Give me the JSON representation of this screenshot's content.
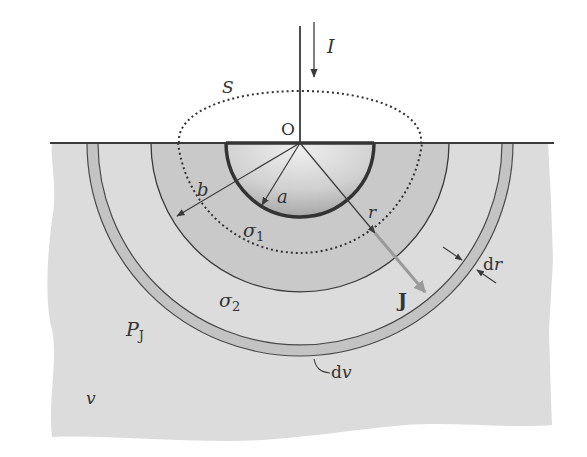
{
  "figure": {
    "labels": {
      "current": "I",
      "surface": "S",
      "origin": "O",
      "inner_radius": "a",
      "outer_radius": "b",
      "radius": "r",
      "sigma1_base": "σ",
      "sigma1_sub": "1",
      "sigma2_base": "σ",
      "sigma2_sub": "2",
      "current_density": "J",
      "shell_thickness": "dr",
      "shell_volume": "dv",
      "power_base": "P",
      "power_sub": "J",
      "volume": "v"
    },
    "geometry": {
      "center_x": 300,
      "ground_y": 143,
      "electrode_radius_a": 76,
      "dotted_surface_radius": 126,
      "layer_radius_b": 149,
      "shell_inner_radius": 202,
      "shell_outer_radius": 213
    },
    "colors": {
      "background": "#ffffff",
      "ground": "#dcdcdc",
      "layer_sigma1": "#c9c9c9",
      "shell": "#c3c3c3",
      "electrode_light": "#e6e6e6",
      "electrode_dark": "#a8a8a8",
      "line": "#3a3a3a",
      "j_arrow": "#9a9a9a"
    }
  }
}
